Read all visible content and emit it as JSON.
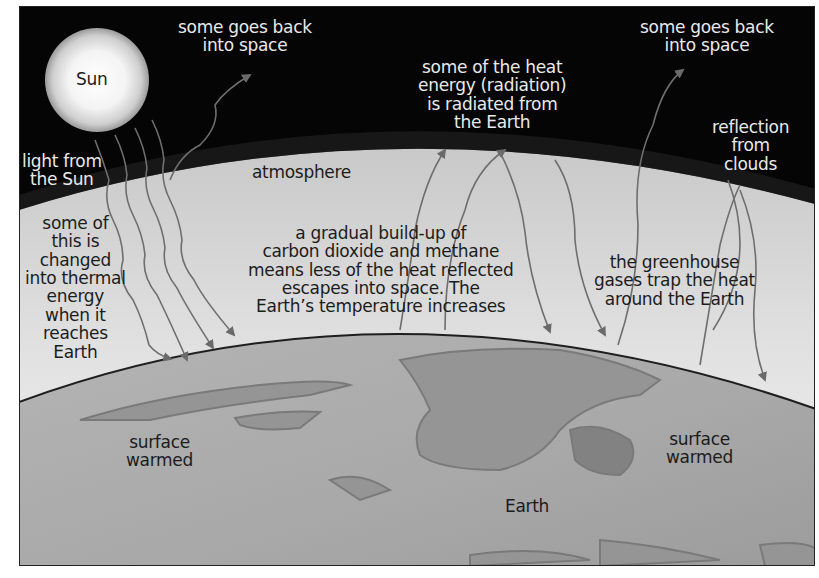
{
  "diagram": {
    "colors": {
      "space": "#050505",
      "atmosphere": "#d8d8d8",
      "earth": "#a9a9a9",
      "land": "#8f8f8f",
      "arrow": "#6e6e6e",
      "border": "#222222"
    },
    "labels": {
      "sun": "Sun",
      "space_left": [
        "some goes back",
        "into space"
      ],
      "space_right": [
        "some goes back",
        "into space"
      ],
      "heat_radiated": [
        "some of the heat",
        "energy (radiation)",
        "is radiated from",
        "the Earth"
      ],
      "light_from_sun": [
        "light from",
        "the Sun"
      ],
      "atmosphere": "atmosphere",
      "reflection": [
        "reflection",
        "from",
        "clouds"
      ],
      "thermal": [
        "some of",
        "this is",
        "changed",
        "into thermal",
        "energy",
        "when it",
        "reaches",
        "Earth"
      ],
      "buildup": [
        "a gradual build-up of",
        "carbon dioxide and methane",
        "means less of the heat reflected",
        "escapes into space. The",
        "Earth’s temperature increases"
      ],
      "greenhouse": [
        "the greenhouse",
        "gases trap the heat",
        "around the Earth"
      ],
      "surface_left": [
        "surface",
        "warmed"
      ],
      "surface_right": [
        "surface",
        "warmed"
      ],
      "earth": "Earth"
    }
  }
}
